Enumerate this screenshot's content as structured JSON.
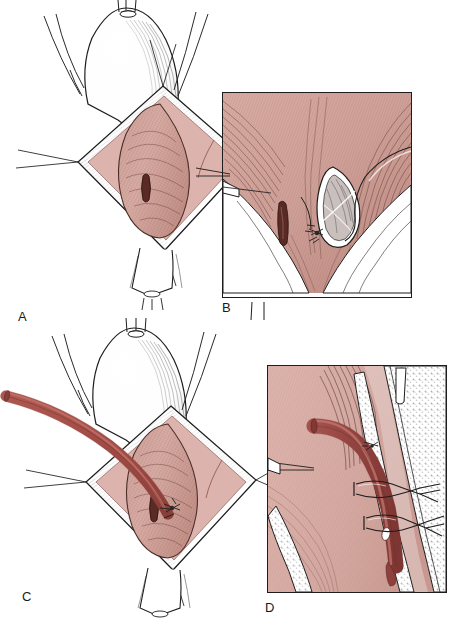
{
  "figure": {
    "background_color": "#ffffff",
    "width": 457,
    "height": 626
  },
  "palette": {
    "tissue_flat_pink": "#ddb4ad",
    "tissue_mid_pink": "#d3a79f",
    "tissue_deep_pink": "#c8988f",
    "hatch_ink": "#5d3b34",
    "catheter_red": "#a8504a",
    "catheter_red_dark": "#8e403c",
    "catheter_highlight": "#c06b63",
    "outline_ink": "#1d1d1d",
    "fascia_white": "#ffffff",
    "metal_grey": "#9a9a9a",
    "label_ink": "#1a1a1a"
  },
  "panels": [
    {
      "id": "A",
      "label": "A",
      "label_x": 18,
      "label_y": 310,
      "caption_role": "overview-exposure",
      "description": "Overview of a diamond-shaped surgical exposure held open by stay sutures; underlying structure visible with a small slit orifice",
      "frame": false,
      "x": 0,
      "y": 0,
      "w": 250,
      "h": 305
    },
    {
      "id": "B",
      "label": "B",
      "label_x": 222,
      "label_y": 303,
      "caption_role": "detail-ductotomy",
      "description": "Magnified inset showing the longitudinal ductotomy opened with a traction suture and a second slit orifice to the left",
      "frame": true,
      "x": 222,
      "y": 92,
      "w": 190,
      "h": 206
    },
    {
      "id": "C",
      "label": "C",
      "label_x": 22,
      "label_y": 592,
      "caption_role": "overview-catheter",
      "description": "Same exposure as A with a catheter introduced from the upper left and seated in the ductotomy",
      "frame": false,
      "x": 0,
      "y": 320,
      "w": 262,
      "h": 300
    },
    {
      "id": "D",
      "label": "D",
      "label_x": 265,
      "label_y": 604,
      "caption_role": "detail-fixation",
      "description": "Magnified sagittal inset showing the catheter lying in the lumen, secured by two encircling anchoring sutures, side hole visible distally",
      "frame": true,
      "x": 267,
      "y": 365,
      "w": 180,
      "h": 228
    }
  ],
  "annotations": {
    "stay_sutures_panel_a": 4,
    "stay_sutures_panel_c": 4,
    "anchoring_sutures_panel_d": 2,
    "catheter_side_holes_panel_d": 1,
    "traction_suture_panel_b": 1
  }
}
